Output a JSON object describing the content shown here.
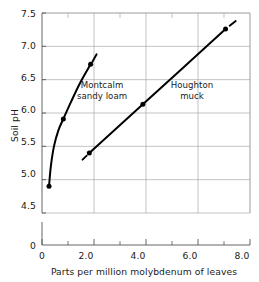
{
  "chart_data": {
    "type": "line",
    "title": "",
    "xlabel": "Parts per million molybdenum of leaves",
    "ylabel": "Soil pH",
    "xlim": [
      0,
      8.0
    ],
    "ylim": [
      4.5,
      7.5
    ],
    "y_axis_break": true,
    "y_origin_label": "0",
    "x_origin_label": "0",
    "grid": true,
    "legend_position": "inline-annotations",
    "xticks": [
      "0",
      "2.0",
      "4.0",
      "6.0",
      "8.0"
    ],
    "xtick_values": [
      0,
      2.0,
      4.0,
      6.0,
      8.0
    ],
    "xminor_values": [
      1.0,
      3.0,
      5.0,
      7.0
    ],
    "yticks": [
      "4.5",
      "5.0",
      "5.5",
      "6.0",
      "6.5",
      "7.0",
      "7.5"
    ],
    "ytick_values": [
      4.5,
      5.0,
      5.5,
      6.0,
      6.5,
      7.0,
      7.5
    ],
    "series": [
      {
        "name": "Montcalm sandy loam",
        "label_lines": [
          "Montcalm",
          "sandy  loam"
        ],
        "points": [
          {
            "x": 0.27,
            "y": 4.9
          },
          {
            "x": 0.82,
            "y": 5.91
          },
          {
            "x": 1.87,
            "y": 6.73
          }
        ],
        "curve": [
          {
            "x": 0.27,
            "y": 4.9
          },
          {
            "x": 0.34,
            "y": 5.2
          },
          {
            "x": 0.46,
            "y": 5.5
          },
          {
            "x": 0.63,
            "y": 5.74
          },
          {
            "x": 0.82,
            "y": 5.91
          },
          {
            "x": 1.12,
            "y": 6.17
          },
          {
            "x": 1.45,
            "y": 6.44
          },
          {
            "x": 1.87,
            "y": 6.73
          }
        ],
        "end_dash": {
          "x1": 1.94,
          "y1": 6.77,
          "x2": 2.1,
          "y2": 6.88
        }
      },
      {
        "name": "Houghton muck",
        "label_lines": [
          "Houghton",
          "muck"
        ],
        "points": [
          {
            "x": 1.82,
            "y": 5.4
          },
          {
            "x": 3.88,
            "y": 6.13
          },
          {
            "x": 7.06,
            "y": 7.26
          }
        ],
        "curve": [
          {
            "x": 1.82,
            "y": 5.4
          },
          {
            "x": 3.88,
            "y": 6.13
          },
          {
            "x": 7.06,
            "y": 7.26
          }
        ],
        "start_dash": {
          "x1": 1.56,
          "y1": 5.3,
          "x2": 1.72,
          "y2": 5.36
        },
        "end_dash": {
          "x1": 7.22,
          "y1": 7.31,
          "x2": 7.45,
          "y2": 7.38
        }
      }
    ],
    "colors": {
      "line": "#000000",
      "marker": "#000000",
      "grid": "#a9a9a9",
      "axis": "#555555",
      "text": "#1a1a1a",
      "background": "#ffffff"
    }
  }
}
